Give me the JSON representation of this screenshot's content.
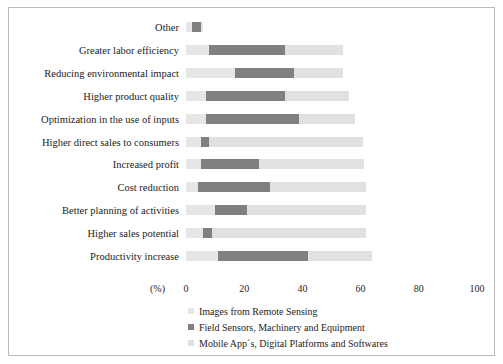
{
  "chart_data": {
    "type": "bar",
    "orientation": "horizontal",
    "stacked": true,
    "title": "",
    "subtitle": "",
    "xlabel": "(%)",
    "ylabel": "",
    "xlim": [
      0,
      100
    ],
    "xticks": [
      0,
      20,
      40,
      60,
      80,
      100
    ],
    "xticklabels": [
      "0",
      "20",
      "40",
      "60",
      "80",
      "100"
    ],
    "grid": false,
    "legend_position": "below",
    "categories": [
      "Other",
      "Greater labor efficiency",
      "Reducing environmental impact",
      "Higher product quality",
      "Optimization in the use of inputs",
      "Higher direct sales to consumers",
      "Increased profit",
      "Cost reduction",
      "Better planning of activities",
      "Higher sales potential",
      "Productivity increase"
    ],
    "series": [
      {
        "name": "Images from Remote Sensing",
        "color": "#e6e6e6",
        "values": [
          2,
          8,
          17,
          7,
          7,
          5,
          5,
          4,
          10,
          6,
          11
        ]
      },
      {
        "name": "Field Sensors, Machinery and Equipment",
        "color": "#808080",
        "values": [
          3,
          26,
          20,
          27,
          32,
          3,
          20,
          25,
          11,
          3,
          31
        ]
      },
      {
        "name": "Mobile App´s, Digital Platforms and Softwares",
        "color": "#e1e1e1",
        "values": [
          1,
          20,
          17,
          22,
          19,
          53,
          36,
          33,
          41,
          53,
          22
        ]
      }
    ]
  },
  "axis": {
    "unit_label": "(%)"
  },
  "legend": {
    "items": [
      {
        "label": "Images from Remote Sensing",
        "color": "#e6e6e6"
      },
      {
        "label": "Field Sensors, Machinery and Equipment",
        "color": "#808080"
      },
      {
        "label": "Mobile App´s, Digital Platforms and Softwares",
        "color": "#e1e1e1"
      }
    ]
  }
}
